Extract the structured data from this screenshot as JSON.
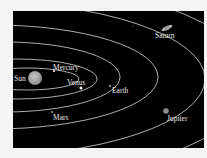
{
  "diagram": {
    "background": "#000000",
    "orbit_color": "#d8d8d8",
    "sun": {
      "label": "Sun",
      "color": "#9a9a9a"
    },
    "planets": [
      {
        "name": "Mercury",
        "label": "Mercury"
      },
      {
        "name": "Venus",
        "label": "Venus"
      },
      {
        "name": "Earth",
        "label": "Earth"
      },
      {
        "name": "Mars",
        "label": "Mars"
      },
      {
        "name": "Jupiter",
        "label": "Jupiter"
      },
      {
        "name": "Saturn",
        "label": "Saturn"
      }
    ]
  }
}
